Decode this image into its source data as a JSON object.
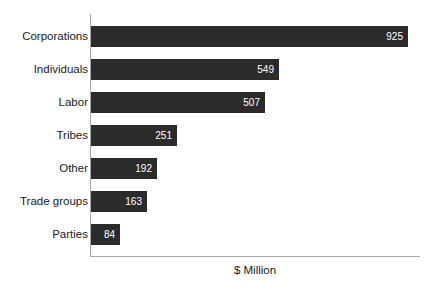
{
  "chart_data": {
    "type": "bar",
    "orientation": "horizontal",
    "title": "",
    "xlabel": "$ Million",
    "ylabel": "",
    "categories": [
      "Corporations",
      "Individuals",
      "Labor",
      "Tribes",
      "Other",
      "Trade groups",
      "Parties"
    ],
    "values": [
      925,
      549,
      507,
      251,
      192,
      163,
      84
    ],
    "value_labels": [
      "925",
      "549",
      "507",
      "251",
      "192",
      "163",
      "84"
    ],
    "series": [
      {
        "name": "",
        "values": [
          925,
          549,
          507,
          251,
          192,
          163,
          84
        ]
      }
    ],
    "xlim": [
      0,
      960
    ],
    "ylim": null,
    "grid": false,
    "legend": null,
    "tick_labels_x": [],
    "annotations": [],
    "colors": {
      "bar": "#2b2b2b",
      "value_label": "#ffffff",
      "category_label": "#1a1a1a",
      "axis": "#a9a9a9",
      "background": "#ffffff"
    }
  },
  "axis": {
    "x_title": "$ Million"
  }
}
